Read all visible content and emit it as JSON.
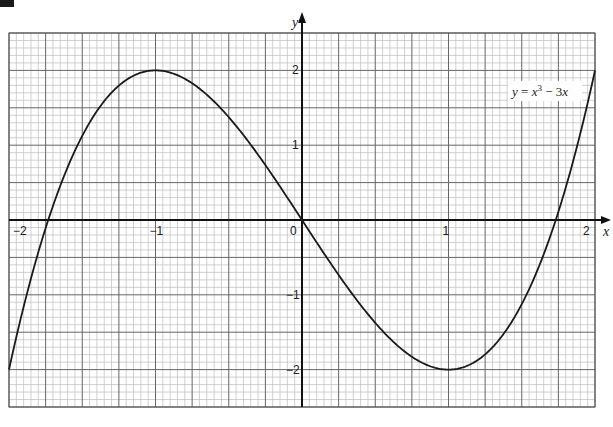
{
  "chart_data": {
    "type": "line",
    "title": "",
    "function": "y = x^3 - 3x",
    "legend_label": "y = x³ − 3x",
    "xlabel": "x",
    "ylabel": "y",
    "xlim": [
      -2,
      2
    ],
    "ylim": [
      -2.5,
      2.5
    ],
    "x_ticks": [
      -2,
      -1,
      0,
      1,
      2
    ],
    "x_tick_labels": [
      "−2",
      "−1",
      "0",
      "1",
      "2"
    ],
    "y_ticks": [
      -2,
      -1,
      1,
      2
    ],
    "y_tick_labels": [
      "−2",
      "−1",
      "1",
      "2"
    ],
    "grid": true,
    "grid_major_x_step": 0.25,
    "grid_major_y_step": 0.5,
    "grid_minor_per_major": 5,
    "series": [
      {
        "name": "y = x³ − 3x",
        "x": [
          -2,
          -1.75,
          -1.5,
          -1.25,
          -1,
          -0.75,
          -0.5,
          -0.25,
          0,
          0.25,
          0.5,
          0.75,
          1,
          1.25,
          1.5,
          1.75,
          2
        ],
        "values": [
          -2,
          0.8906,
          1.875,
          1.7969,
          2,
          1.8281,
          1.375,
          0.7344,
          0,
          -0.7344,
          -1.375,
          -1.8281,
          -2,
          -1.7969,
          -1.125,
          0.1094,
          2
        ]
      }
    ],
    "key_points": [
      {
        "label": "local max",
        "x": -1,
        "y": 2
      },
      {
        "label": "local min",
        "x": 1,
        "y": -2
      },
      {
        "label": "origin",
        "x": 0,
        "y": 0
      }
    ]
  },
  "labels": {
    "x_axis": "x",
    "y_axis": "y",
    "origin": "0",
    "equation_y": "y = x",
    "equation_exp": "3",
    "equation_rest": " − 3x"
  }
}
